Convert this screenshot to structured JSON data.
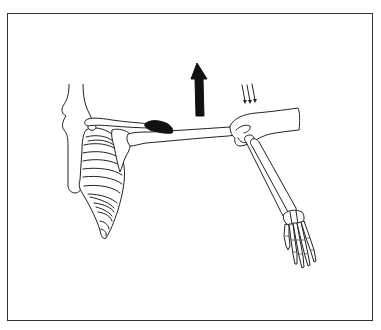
{
  "figure": {
    "colors": {
      "background": "#ffffff",
      "line": "#222222",
      "frame": "#333333",
      "arrow": "#111111",
      "muscle_highlight": "#111111"
    },
    "elements": {
      "frame": "border-frame",
      "spine": "cervical-thoracic-spine",
      "rib_cage": "rib-cage",
      "scapula": "scapula",
      "clavicle": "clavicle",
      "muscle": "shaded-muscle-region",
      "humerus": "humerus",
      "examiner_hand": "examiner-hand",
      "forearm": "radius-ulna",
      "hand": "hand-skeleton",
      "force_arrow": "upward-arrow",
      "pressure_arrows": "three-downward-arrows"
    },
    "pressure_arrow_count": 3
  }
}
